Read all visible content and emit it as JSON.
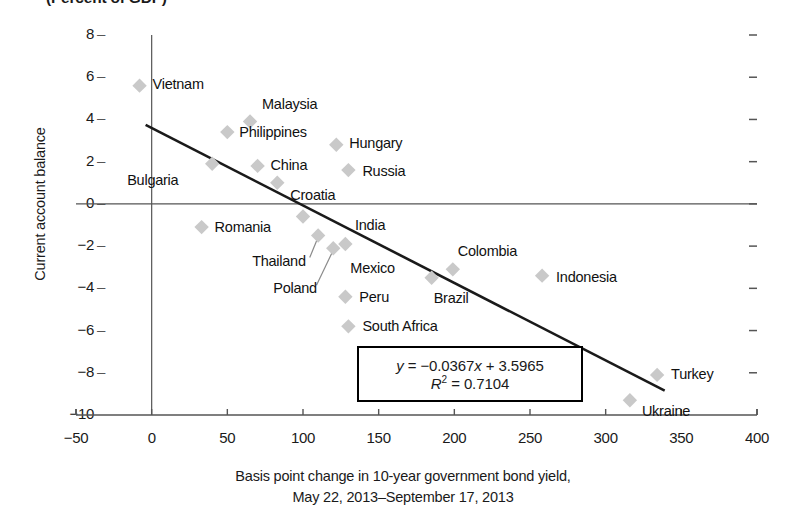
{
  "chart_data": {
    "type": "scatter",
    "title": "(Percent of GDP)",
    "xlabel_line1": "Basis point change in 10-year government bond yield,",
    "xlabel_line2": "May 22, 2013–September 17, 2013",
    "ylabel": "Current account balance",
    "xlim": [
      -50,
      400
    ],
    "ylim": [
      -10,
      8
    ],
    "xticks": [
      "−50",
      "0",
      "50",
      "100",
      "150",
      "200",
      "250",
      "300",
      "350",
      "400"
    ],
    "xtick_values": [
      -50,
      0,
      50,
      100,
      150,
      200,
      250,
      300,
      350,
      400
    ],
    "yticks": [
      "8",
      "6",
      "4",
      "2",
      "0",
      "−2",
      "−4",
      "−6",
      "−8",
      "−10"
    ],
    "ytick_values": [
      8,
      6,
      4,
      2,
      0,
      -2,
      -4,
      -6,
      -8,
      -10
    ],
    "grid": false,
    "legend": "none",
    "marker_color": "#c9c9c9",
    "trendline_color": "#1a1a1a",
    "axis_color": "#555555",
    "points": [
      {
        "name": "Vietnam",
        "x": -8,
        "y": 5.6,
        "label_dx": 13,
        "label_dy": -1,
        "leader": false
      },
      {
        "name": "Malaysia",
        "x": 65,
        "y": 3.9,
        "label_dx": 12,
        "label_dy": -17,
        "leader": false
      },
      {
        "name": "Philippines",
        "x": 50,
        "y": 3.4,
        "label_dx": 12,
        "label_dy": 1,
        "leader": false
      },
      {
        "name": "Hungary",
        "x": 122,
        "y": 2.8,
        "label_dx": 13,
        "label_dy": -1,
        "leader": false
      },
      {
        "name": "Bulgaria",
        "x": 40,
        "y": 1.9,
        "label_dx": -85,
        "label_dy": 17,
        "leader": false
      },
      {
        "name": "China",
        "x": 70,
        "y": 1.8,
        "label_dx": 13,
        "label_dy": 0,
        "leader": false
      },
      {
        "name": "Russia",
        "x": 130,
        "y": 1.6,
        "label_dx": 14,
        "label_dy": 2,
        "leader": false
      },
      {
        "name": "Croatia",
        "x": 83,
        "y": 1.0,
        "label_dx": 13,
        "label_dy": 13,
        "leader": false
      },
      {
        "name": "Romania",
        "x": 33,
        "y": -1.1,
        "label_dx": 13,
        "label_dy": 1,
        "leader": false
      },
      {
        "name": "India",
        "x": 100,
        "y": -0.6,
        "label_dx": 52,
        "label_dy": 9,
        "leader": false
      },
      {
        "name": "Thailand",
        "x": 110,
        "y": -1.5,
        "label_dx": -66,
        "label_dy": 26,
        "leader": true
      },
      {
        "name": "Poland",
        "x": 120,
        "y": -2.1,
        "label_dx": -60,
        "label_dy": 41,
        "leader": true
      },
      {
        "name": "Mexico",
        "x": 128,
        "y": -1.9,
        "label_dx": 5,
        "label_dy": 25,
        "leader": false
      },
      {
        "name": "Peru",
        "x": 128,
        "y": -4.4,
        "label_dx": 14,
        "label_dy": 1,
        "leader": false
      },
      {
        "name": "South Africa",
        "x": 130,
        "y": -5.8,
        "label_dx": 14,
        "label_dy": 1,
        "leader": false
      },
      {
        "name": "Brazil",
        "x": 185,
        "y": -3.5,
        "label_dx": 2,
        "label_dy": 21,
        "leader": false
      },
      {
        "name": "Colombia",
        "x": 199,
        "y": -3.1,
        "label_dx": 5,
        "label_dy": -17,
        "leader": false
      },
      {
        "name": "Indonesia",
        "x": 258,
        "y": -3.4,
        "label_dx": 14,
        "label_dy": 2,
        "leader": false
      },
      {
        "name": "Turkey",
        "x": 334,
        "y": -8.1,
        "label_dx": 14,
        "label_dy": 0,
        "leader": false
      },
      {
        "name": "Ukraine",
        "x": 316,
        "y": -9.3,
        "label_dx": 12,
        "label_dy": 12,
        "leader": false
      }
    ],
    "trendline": {
      "slope": -0.0367,
      "intercept": 3.5965,
      "r_squared": 0.7104,
      "x_start": -4,
      "x_end": 339,
      "equation_text": "y = −0.0367x + 3.5965",
      "r2_text": "R² = 0.7104"
    },
    "annotations": {
      "eq_prefix_y": "y",
      "eq_equals": "=",
      "eq_body": "−0.0367",
      "eq_var": "x",
      "eq_tail": "+ 3.5965",
      "r2_prefix": "R",
      "r2_sup": "2",
      "r2_equals": "=",
      "r2_value": "0.7104"
    }
  }
}
